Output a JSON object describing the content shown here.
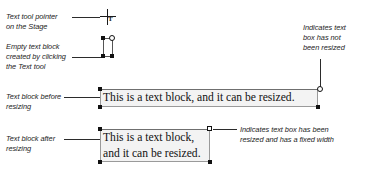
{
  "colors": {
    "ink": "#1c1c1c",
    "leader": "#2b2b2b",
    "box_fill": "#f3f3f3",
    "box_border": "#9a9a9a",
    "handle_fill": "#111111",
    "handle_open": "#ffffff"
  },
  "callouts": {
    "pointer": {
      "line1": "Text tool pointer",
      "line2": "on the Stage"
    },
    "empty_block": {
      "line1": "Empty text block",
      "line2": "created by clicking",
      "line3": "the Text tool"
    },
    "before": {
      "line1": "Text block before",
      "line2": "resizing"
    },
    "after": {
      "line1": "Text block after",
      "line2": "resizing"
    },
    "not_resized": {
      "line1": "Indicates text",
      "line2": "box has not",
      "line3": "been resized"
    },
    "resized": {
      "line1": "Indicates text box has been",
      "line2": "resized and has a fixed width"
    }
  },
  "icons": {
    "text_tool_glyph": "T"
  },
  "text_blocks": {
    "before": {
      "lines": [
        "This is a text block, and it can be resized."
      ],
      "handle_top_right": "circle-handle"
    },
    "after": {
      "lines": [
        "This is a text block,",
        "and it can be resized."
      ],
      "handle_top_right": "square-open-handle"
    }
  }
}
